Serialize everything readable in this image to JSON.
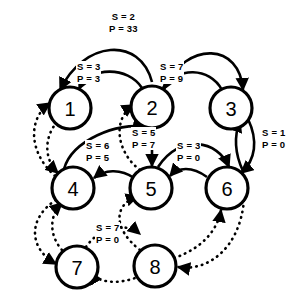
{
  "diagram": {
    "background_color": "#ffffff",
    "stroke_color": "#000000",
    "nodes": [
      {
        "id": "1",
        "label": "1",
        "cx": 70,
        "cy": 108,
        "r": 21
      },
      {
        "id": "2",
        "label": "2",
        "cx": 152,
        "cy": 107,
        "r": 21
      },
      {
        "id": "3",
        "label": "3",
        "cx": 231,
        "cy": 108,
        "r": 21
      },
      {
        "id": "4",
        "label": "4",
        "cx": 73,
        "cy": 188,
        "r": 21
      },
      {
        "id": "5",
        "label": "5",
        "cx": 151,
        "cy": 188,
        "r": 21
      },
      {
        "id": "6",
        "label": "6",
        "cx": 227,
        "cy": 188,
        "r": 21
      },
      {
        "id": "7",
        "label": "7",
        "cx": 77,
        "cy": 267,
        "r": 21
      },
      {
        "id": "8",
        "label": "8",
        "cx": 155,
        "cy": 266,
        "r": 21
      }
    ],
    "edge_labels": [
      {
        "id": "label-1-2-outer",
        "s": "S = 2",
        "p": "P = 33",
        "x": 126,
        "y": 11,
        "style": "solid"
      },
      {
        "id": "label-1-2",
        "s": "S = 3",
        "p": "P = 3",
        "x": 93,
        "y": 62,
        "style": "solid"
      },
      {
        "id": "label-2-3",
        "s": "S = 7",
        "p": "P = 9",
        "x": 176,
        "y": 62,
        "style": "solid"
      },
      {
        "id": "label-3-6",
        "s": "S = 1",
        "p": "P = 0",
        "x": 262,
        "y": 128,
        "style": "solid"
      },
      {
        "id": "label-2-5",
        "s": "S = 5",
        "p": "P = 7",
        "x": 131,
        "y": 128,
        "style": "solid"
      },
      {
        "id": "label-4-5",
        "s": "S = 6",
        "p": "P = 5",
        "x": 88,
        "y": 141,
        "style": "dotted"
      },
      {
        "id": "label-5-6",
        "s": "S = 3",
        "p": "P = 0",
        "x": 181,
        "y": 141,
        "style": "solid"
      },
      {
        "id": "label-7-8",
        "s": "S = 7",
        "p": "P = 0",
        "x": 98,
        "y": 223,
        "style": "dotted"
      }
    ],
    "edges": [
      {
        "id": "edge-1-to-2-outer",
        "from": "1",
        "to": "2",
        "style": "solid",
        "labeled_by": "label-1-2-outer"
      },
      {
        "id": "edge-2-to-3-outer",
        "from": "2",
        "to": "3",
        "style": "solid",
        "labeled_by": "label-1-2-outer"
      },
      {
        "id": "edge-2-to-1",
        "from": "2",
        "to": "1",
        "style": "solid",
        "labeled_by": "label-1-2"
      },
      {
        "id": "edge-3-to-2",
        "from": "3",
        "to": "2",
        "style": "solid",
        "labeled_by": "label-2-3"
      },
      {
        "id": "edge-3-to-6",
        "from": "3",
        "to": "6",
        "style": "solid",
        "labeled_by": "label-3-6"
      },
      {
        "id": "edge-6-to-3",
        "from": "6",
        "to": "3",
        "style": "solid",
        "labeled_by": "label-3-6"
      },
      {
        "id": "edge-4-to-2",
        "from": "4",
        "to": "2",
        "style": "solid",
        "labeled_by": "label-2-5"
      },
      {
        "id": "edge-2-to-5",
        "from": "2",
        "to": "5",
        "style": "solid",
        "labeled_by": "label-2-5"
      },
      {
        "id": "edge-6-to-5",
        "from": "6",
        "to": "5",
        "style": "solid",
        "labeled_by": "label-5-6"
      },
      {
        "id": "edge-5-to-6",
        "from": "5",
        "to": "6",
        "style": "solid",
        "labeled_by": "label-5-6"
      },
      {
        "id": "edge-5-to-4",
        "from": "5",
        "to": "4",
        "style": "solid",
        "labeled_by": "label-4-5"
      },
      {
        "id": "edge-5-to-2-dotted",
        "from": "5",
        "to": "2",
        "style": "dotted",
        "labeled_by": "label-4-5"
      },
      {
        "id": "edge-4-to-1-dotted",
        "from": "4",
        "to": "1",
        "style": "dotted",
        "labeled_by": null
      },
      {
        "id": "edge-1-to-4-dotted",
        "from": "1",
        "to": "4",
        "style": "dotted",
        "labeled_by": null
      },
      {
        "id": "edge-4-to-7-dotted",
        "from": "4",
        "to": "7",
        "style": "dotted",
        "labeled_by": null
      },
      {
        "id": "edge-7-to-4-dotted",
        "from": "7",
        "to": "4",
        "style": "dotted",
        "labeled_by": null
      },
      {
        "id": "edge-7-to-8-dotted",
        "from": "7",
        "to": "8",
        "style": "dotted",
        "labeled_by": "label-7-8"
      },
      {
        "id": "edge-8-to-7-dotted",
        "from": "8",
        "to": "7",
        "style": "dotted",
        "labeled_by": "label-7-8"
      },
      {
        "id": "edge-8-to-5-dotted",
        "from": "8",
        "to": "5",
        "style": "dotted",
        "labeled_by": null
      },
      {
        "id": "edge-8-to-6-dotted",
        "from": "8",
        "to": "6",
        "style": "dotted",
        "labeled_by": null
      },
      {
        "id": "edge-6-to-8-dotted",
        "from": "6",
        "to": "8",
        "style": "dotted",
        "labeled_by": null
      }
    ]
  }
}
